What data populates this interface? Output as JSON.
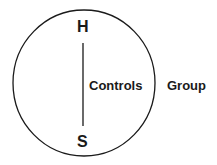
{
  "diagram": {
    "top_label": "H",
    "bottom_label": "S",
    "inner_label": "Controls",
    "outer_label": "Group",
    "stroke_color": "#1a1a1a",
    "background": "#ffffff"
  }
}
